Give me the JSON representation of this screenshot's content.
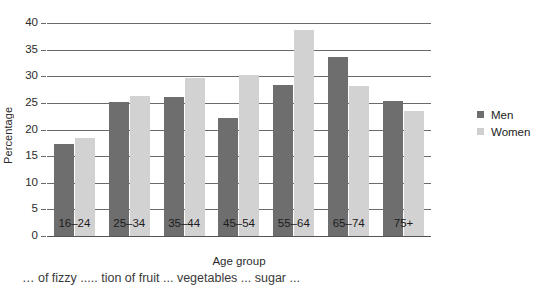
{
  "chart_data": {
    "type": "bar",
    "title": "",
    "xlabel": "Age group",
    "ylabel": "Percentage",
    "categories": [
      "16–24",
      "25–34",
      "35–44",
      "45–54",
      "55–64",
      "65–74",
      "75+"
    ],
    "series": [
      {
        "name": "Men",
        "color": "#6e6e6e",
        "values": [
          17.3,
          25.2,
          26.2,
          22.2,
          28.3,
          33.6,
          25.4
        ]
      },
      {
        "name": "Women",
        "color": "#d2d2d2",
        "values": [
          18.4,
          26.3,
          29.7,
          30.3,
          38.7,
          28.2,
          23.5
        ]
      }
    ],
    "ylim": [
      0,
      40
    ],
    "ytick_values": [
      0,
      5,
      10,
      15,
      20,
      25,
      30,
      35,
      40
    ],
    "ytick_labels": [
      "0",
      "5",
      "10",
      "15",
      "20",
      "25",
      "30",
      "35",
      "40"
    ],
    "grid": true,
    "legend_position": "right"
  },
  "legend": {
    "entries": [
      {
        "label": "Men"
      },
      {
        "label": "Women"
      }
    ]
  },
  "caption": {
    "text": "… of fizzy ..... tion of fruit ... vegetables ... sugar ..."
  }
}
